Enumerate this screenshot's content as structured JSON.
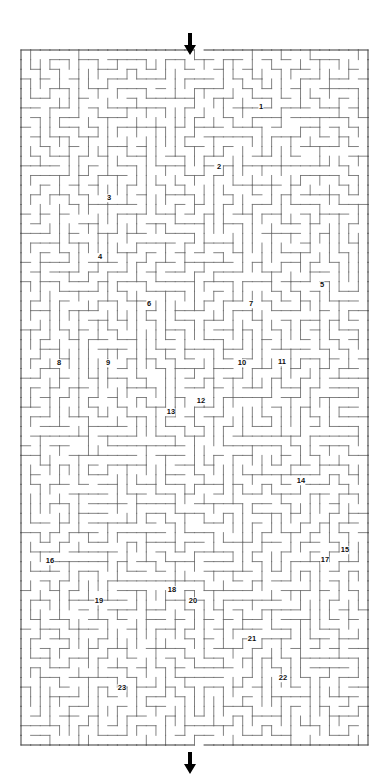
{
  "puzzle": {
    "type": "maze",
    "title": "",
    "grid": {
      "cols": 36,
      "rows": 72,
      "cell_px": 9.65
    },
    "bounds": {
      "x": 21,
      "y": 50,
      "width": 347,
      "height": 695
    },
    "colors": {
      "wall": "#6b6b6b",
      "border": "#4a4a4a",
      "label": "#111111",
      "arrow": "#000000",
      "background": "#ffffff"
    },
    "entrance": {
      "name": "entry-arrow",
      "x": 190,
      "y": 33,
      "direction": "down",
      "gap_x": 190
    },
    "exit": {
      "name": "exit-arrow",
      "x": 190,
      "y": 752,
      "direction": "down",
      "gap_x": 190
    }
  },
  "labels": [
    {
      "id": 1,
      "text": "1",
      "x": 261,
      "y": 107
    },
    {
      "id": 2,
      "text": "2",
      "x": 219,
      "y": 167
    },
    {
      "id": 3,
      "text": "3",
      "x": 109,
      "y": 198
    },
    {
      "id": 4,
      "text": "4",
      "x": 100,
      "y": 257
    },
    {
      "id": 5,
      "text": "5",
      "x": 322,
      "y": 285
    },
    {
      "id": 6,
      "text": "6",
      "x": 149,
      "y": 304
    },
    {
      "id": 7,
      "text": "7",
      "x": 251,
      "y": 304
    },
    {
      "id": 8,
      "text": "8",
      "x": 59,
      "y": 363
    },
    {
      "id": 9,
      "text": "9",
      "x": 108,
      "y": 363
    },
    {
      "id": 10,
      "text": "10",
      "x": 242,
      "y": 363
    },
    {
      "id": 11,
      "text": "11",
      "x": 282,
      "y": 362
    },
    {
      "id": 12,
      "text": "12",
      "x": 201,
      "y": 401
    },
    {
      "id": 13,
      "text": "13",
      "x": 171,
      "y": 412
    },
    {
      "id": 14,
      "text": "14",
      "x": 301,
      "y": 481
    },
    {
      "id": 15,
      "text": "15",
      "x": 345,
      "y": 550
    },
    {
      "id": 16,
      "text": "16",
      "x": 50,
      "y": 561
    },
    {
      "id": 17,
      "text": "17",
      "x": 325,
      "y": 560
    },
    {
      "id": 18,
      "text": "18",
      "x": 172,
      "y": 590
    },
    {
      "id": 19,
      "text": "19",
      "x": 99,
      "y": 601
    },
    {
      "id": 20,
      "text": "20",
      "x": 193,
      "y": 601
    },
    {
      "id": 21,
      "text": "21",
      "x": 252,
      "y": 639
    },
    {
      "id": 22,
      "text": "22",
      "x": 283,
      "y": 678
    },
    {
      "id": 23,
      "text": "23",
      "x": 122,
      "y": 688
    }
  ]
}
